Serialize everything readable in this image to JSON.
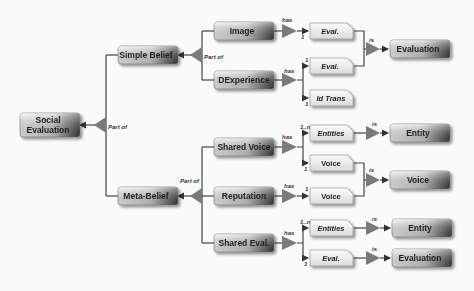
{
  "diagram": {
    "nodes": {
      "social_evaluation": {
        "line1": "Social",
        "line2": "Evaluation"
      },
      "simple_belief": "Simple Belief",
      "meta_belief": "Meta-Belief",
      "image": "Image",
      "dexperience": "DExperience",
      "shared_voice": "Shared Voice",
      "reputation": "Reputation",
      "shared_eval": "Shared Eval."
    },
    "attributes": {
      "image_eval": "Eval.",
      "dexp_eval": "Eval.",
      "dexp_idtrans": "Id Trans",
      "sv_entities": "Entities",
      "sv_voice": "Voice",
      "rep_voice": "Voice",
      "se_entities": "Entities",
      "se_eval": "Eval."
    },
    "targets": {
      "evaluation_top": "Evaluation",
      "entity_1": "Entity",
      "voice": "Voice",
      "entity_2": "Entity",
      "evaluation_bottom": "Evaluation"
    },
    "edge_labels": {
      "part_of": "Part of",
      "has": "has",
      "is": "is",
      "one": "1",
      "one_to_n": "1..n"
    }
  }
}
